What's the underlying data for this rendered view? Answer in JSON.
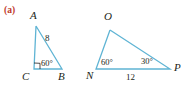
{
  "figure": {
    "part_label": "(a)",
    "stroke_color": "#5FB4D4",
    "label_color": "#231f20",
    "part_label_color": "#c0392b",
    "background_color": "#ffffff",
    "triangles": [
      {
        "name": "triangle-abc",
        "vertices": [
          {
            "id": "A",
            "label": "A",
            "x": 36,
            "y": 26
          },
          {
            "id": "B",
            "label": "B",
            "x": 62,
            "y": 69
          },
          {
            "id": "C",
            "label": "C",
            "x": 34,
            "y": 69
          }
        ],
        "vertex_labels": [
          {
            "id": "A",
            "text": "A",
            "x": 30,
            "y": 10
          },
          {
            "id": "C",
            "text": "C",
            "x": 25,
            "y": 71
          },
          {
            "id": "B",
            "text": "B",
            "x": 61,
            "y": 71
          }
        ],
        "angles": [
          {
            "at": "C",
            "text": "90°",
            "marker": "right-angle",
            "shown": false
          },
          {
            "at": "B",
            "text": "60°",
            "marker": "arc",
            "shown": true,
            "x": 38,
            "y": 60
          }
        ],
        "sides": [
          {
            "from": "A",
            "to": "B",
            "text": "8",
            "x": 47,
            "y": 38
          }
        ]
      },
      {
        "name": "triangle-nop",
        "vertices": [
          {
            "id": "O",
            "label": "O",
            "x": 110,
            "y": 30
          },
          {
            "id": "N",
            "label": "N",
            "x": 96,
            "y": 69
          },
          {
            "id": "P",
            "label": "P",
            "x": 170,
            "y": 69
          }
        ],
        "vertex_labels": [
          {
            "id": "O",
            "text": "O",
            "x": 104,
            "y": 11
          },
          {
            "id": "N",
            "text": "N",
            "x": 88,
            "y": 71
          },
          {
            "id": "P",
            "text": "P",
            "x": 172,
            "y": 64
          }
        ],
        "angles": [
          {
            "at": "N",
            "text": "60°",
            "marker": "none",
            "shown": true,
            "x": 101,
            "y": 59
          },
          {
            "at": "P",
            "text": "30°",
            "marker": "none",
            "shown": true,
            "x": 141,
            "y": 58
          }
        ],
        "sides": [
          {
            "from": "N",
            "to": "P",
            "text": "12",
            "x": 128,
            "y": 74
          }
        ]
      }
    ]
  }
}
